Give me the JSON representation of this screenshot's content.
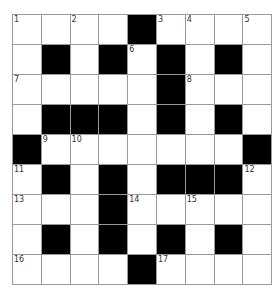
{
  "puzzle": {
    "rows": 9,
    "cols": 9,
    "colors": {
      "black": "#000000",
      "white": "#ffffff",
      "grid_line": "#9a9a9a"
    },
    "layout": [
      "....#....",
      ".#.#.#.#.",
      ".....#...",
      ".###.#.#.",
      "#.......#",
      ".#.#.###.",
      "...#.....",
      ".#.#.#.#.",
      "....#...."
    ],
    "numbers": [
      {
        "r": 0,
        "c": 0,
        "n": "1"
      },
      {
        "r": 0,
        "c": 2,
        "n": "2"
      },
      {
        "r": 0,
        "c": 5,
        "n": "3"
      },
      {
        "r": 0,
        "c": 6,
        "n": "4"
      },
      {
        "r": 0,
        "c": 8,
        "n": "5"
      },
      {
        "r": 1,
        "c": 4,
        "n": "6"
      },
      {
        "r": 2,
        "c": 0,
        "n": "7"
      },
      {
        "r": 2,
        "c": 6,
        "n": "8"
      },
      {
        "r": 4,
        "c": 1,
        "n": "9"
      },
      {
        "r": 4,
        "c": 2,
        "n": "10"
      },
      {
        "r": 5,
        "c": 0,
        "n": "11"
      },
      {
        "r": 5,
        "c": 8,
        "n": "12"
      },
      {
        "r": 6,
        "c": 0,
        "n": "13"
      },
      {
        "r": 6,
        "c": 4,
        "n": "14"
      },
      {
        "r": 6,
        "c": 6,
        "n": "15"
      },
      {
        "r": 8,
        "c": 0,
        "n": "16"
      },
      {
        "r": 8,
        "c": 5,
        "n": "17"
      }
    ]
  }
}
